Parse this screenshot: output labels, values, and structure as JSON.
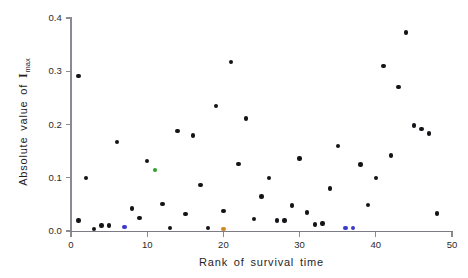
{
  "chart_data": {
    "type": "scatter",
    "title": "",
    "xlabel": "Rank of survival time",
    "ylabel": "Absolute value of Imax",
    "ylabel_parts": {
      "prefix": "Absolute  value  of  ",
      "symbol": "I",
      "subscript": "max"
    },
    "xlim": [
      0,
      50
    ],
    "ylim": [
      0,
      0.4
    ],
    "xticks": [
      0,
      10,
      20,
      30,
      40,
      50
    ],
    "xtick_labels": [
      "0",
      "10",
      "20",
      "30",
      "40",
      "50"
    ],
    "yticks": [
      0.0,
      0.1,
      0.2,
      0.3,
      0.4
    ],
    "ytick_labels": [
      "0.0",
      "0.1",
      "0.2",
      "0.3",
      "0.4"
    ],
    "grid": false,
    "legend": "none",
    "marker": "filled-circle",
    "colors": {
      "black": "#141418",
      "green": "#2ca02c",
      "blue": "#3a3ad0",
      "purple": "#7a3fa0",
      "orange": "#d08a20"
    },
    "points": [
      {
        "x": 1,
        "y": 0.02,
        "color": "black"
      },
      {
        "x": 1,
        "y": 0.291,
        "color": "black"
      },
      {
        "x": 2,
        "y": 0.1,
        "color": "black"
      },
      {
        "x": 3,
        "y": 0.004,
        "color": "black"
      },
      {
        "x": 4,
        "y": 0.01,
        "color": "black"
      },
      {
        "x": 5,
        "y": 0.01,
        "color": "black"
      },
      {
        "x": 6,
        "y": 0.167,
        "color": "black"
      },
      {
        "x": 7,
        "y": 0.008,
        "color": "blue"
      },
      {
        "x": 8,
        "y": 0.042,
        "color": "black"
      },
      {
        "x": 9,
        "y": 0.024,
        "color": "black"
      },
      {
        "x": 10,
        "y": 0.131,
        "color": "black"
      },
      {
        "x": 11,
        "y": 0.115,
        "color": "green"
      },
      {
        "x": 12,
        "y": 0.051,
        "color": "black"
      },
      {
        "x": 13,
        "y": 0.006,
        "color": "black"
      },
      {
        "x": 14,
        "y": 0.188,
        "color": "black"
      },
      {
        "x": 15,
        "y": 0.032,
        "color": "black"
      },
      {
        "x": 16,
        "y": 0.179,
        "color": "black"
      },
      {
        "x": 17,
        "y": 0.086,
        "color": "black"
      },
      {
        "x": 18,
        "y": 0.006,
        "color": "black"
      },
      {
        "x": 19,
        "y": 0.235,
        "color": "black"
      },
      {
        "x": 20,
        "y": 0.004,
        "color": "orange"
      },
      {
        "x": 20,
        "y": 0.038,
        "color": "black"
      },
      {
        "x": 21,
        "y": 0.317,
        "color": "black"
      },
      {
        "x": 22,
        "y": 0.126,
        "color": "black"
      },
      {
        "x": 23,
        "y": 0.211,
        "color": "black"
      },
      {
        "x": 24,
        "y": 0.022,
        "color": "black"
      },
      {
        "x": 25,
        "y": 0.065,
        "color": "black"
      },
      {
        "x": 26,
        "y": 0.1,
        "color": "black"
      },
      {
        "x": 27,
        "y": 0.02,
        "color": "black"
      },
      {
        "x": 28,
        "y": 0.02,
        "color": "black"
      },
      {
        "x": 29,
        "y": 0.048,
        "color": "black"
      },
      {
        "x": 30,
        "y": 0.136,
        "color": "black"
      },
      {
        "x": 31,
        "y": 0.035,
        "color": "black"
      },
      {
        "x": 32,
        "y": 0.012,
        "color": "black"
      },
      {
        "x": 33,
        "y": 0.014,
        "color": "black"
      },
      {
        "x": 34,
        "y": 0.08,
        "color": "black"
      },
      {
        "x": 35,
        "y": 0.16,
        "color": "black"
      },
      {
        "x": 36,
        "y": 0.006,
        "color": "blue"
      },
      {
        "x": 37,
        "y": 0.006,
        "color": "blue"
      },
      {
        "x": 38,
        "y": 0.125,
        "color": "black"
      },
      {
        "x": 39,
        "y": 0.049,
        "color": "black"
      },
      {
        "x": 40,
        "y": 0.1,
        "color": "black"
      },
      {
        "x": 41,
        "y": 0.31,
        "color": "black"
      },
      {
        "x": 42,
        "y": 0.142,
        "color": "black"
      },
      {
        "x": 43,
        "y": 0.27,
        "color": "black"
      },
      {
        "x": 44,
        "y": 0.373,
        "color": "black"
      },
      {
        "x": 45,
        "y": 0.198,
        "color": "black"
      },
      {
        "x": 46,
        "y": 0.192,
        "color": "black"
      },
      {
        "x": 47,
        "y": 0.183,
        "color": "black"
      },
      {
        "x": 48,
        "y": 0.033,
        "color": "black"
      }
    ]
  }
}
